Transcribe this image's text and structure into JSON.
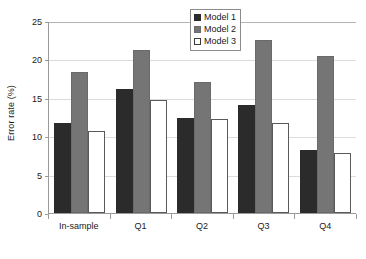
{
  "chart_data": {
    "type": "bar",
    "title": "",
    "xlabel": "",
    "ylabel": "Error rate (%)",
    "ylim": [
      0,
      25
    ],
    "yticks": [
      0,
      5,
      10,
      15,
      20,
      25
    ],
    "ytick_labels": [
      "0",
      "5",
      "10",
      "15",
      "20",
      "25"
    ],
    "grid": true,
    "legend_position": "top-right",
    "categories": [
      "In-sample",
      "Q1",
      "Q2",
      "Q3",
      "Q4"
    ],
    "series": [
      {
        "name": "Model 1",
        "color": "#2b2b2b",
        "values": [
          11.8,
          16.2,
          12.4,
          14.2,
          8.2
        ]
      },
      {
        "name": "Model 2",
        "color": "#757575",
        "values": [
          18.5,
          21.4,
          17.2,
          22.7,
          20.6
        ]
      },
      {
        "name": "Model 3",
        "color": "#ffffff",
        "values": [
          10.8,
          14.8,
          12.3,
          11.8,
          7.9
        ]
      }
    ]
  }
}
